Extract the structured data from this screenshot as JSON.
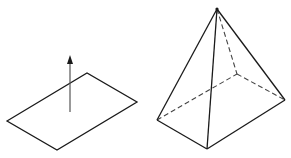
{
  "figure": {
    "colors": {
      "stroke": "#1a1a1a",
      "arrow": "#555555",
      "background": "#ffffff"
    },
    "plane": {
      "vertices": [
        [
          7,
          121
        ],
        [
          87,
          73
        ],
        [
          137,
          102
        ],
        [
          57,
          150
        ]
      ],
      "normal_arrow": {
        "from": [
          70,
          112
        ],
        "to": [
          70,
          56
        ]
      }
    },
    "pyramid": {
      "apex": [
        217,
        9
      ],
      "base": {
        "left": [
          157,
          120
        ],
        "front": [
          207,
          149
        ],
        "right": [
          285,
          100
        ],
        "back": [
          237,
          74
        ]
      },
      "visible_edges": [
        "apex-left",
        "apex-front",
        "apex-right",
        "left-front",
        "front-right"
      ],
      "hidden_edges": [
        "apex-back",
        "left-back",
        "back-right"
      ]
    }
  }
}
